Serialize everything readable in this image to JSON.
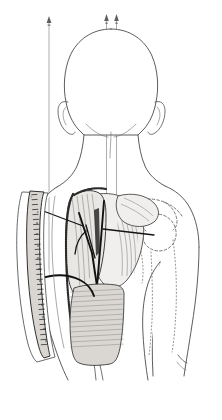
{
  "figure": {
    "view": "posterior",
    "background_color": "#ffffff",
    "ink_color": "#3d3d3d",
    "accent_black": "#111111",
    "muscle_fill": "#e9e7e4",
    "bone_outline_style": "dashed"
  },
  "leaders": {
    "description": "Thin vertical leader lines with arrowheads extending off the top of the figure",
    "items": [
      {
        "id": "leader-left",
        "label": "",
        "x": 49,
        "top_y": 18,
        "bottom_y": 284,
        "arrow": "up"
      },
      {
        "id": "leader-center",
        "label": "",
        "x": 107,
        "top_y": 15,
        "bottom_y": 215,
        "arrow": "up"
      },
      {
        "id": "leader-right",
        "label": "",
        "x": 116,
        "top_y": 15,
        "bottom_y": 205,
        "arrow": "up"
      }
    ]
  },
  "anatomy": {
    "regions": [
      {
        "name": "head",
        "label": "Head (posterior view)"
      },
      {
        "name": "neck",
        "label": "Neck"
      },
      {
        "name": "left-ear",
        "label": "Ear"
      },
      {
        "name": "right-ear",
        "label": "Ear"
      },
      {
        "name": "torso",
        "label": "Posterior trunk"
      },
      {
        "name": "right-arm",
        "label": "Upper arm"
      }
    ],
    "bones": [
      {
        "name": "scapula",
        "label": "Scapula",
        "style": "dashed"
      },
      {
        "name": "clavicle",
        "label": "Clavicle",
        "style": "dashed"
      },
      {
        "name": "humerus",
        "label": "Humerus",
        "style": "dotted"
      },
      {
        "name": "acromion",
        "label": "Acromion",
        "style": "dashed"
      }
    ],
    "flap": {
      "name": "latissimus-dorsi-flap",
      "label": "Elevated muscle flap",
      "fill": "#e9e7e4",
      "edge": "stippled incision margin"
    }
  },
  "inset": {
    "name": "donor-site-inset",
    "label": "Donor site closure detail",
    "strip_label": "Sutured incision line",
    "strip_fill": "#d9d6d2"
  },
  "pointers": [
    {
      "id": "pointer-upper-left",
      "label": ""
    },
    {
      "id": "pointer-mid-right",
      "label": ""
    },
    {
      "id": "pointer-lower-left",
      "label": ""
    },
    {
      "id": "pointer-vessel",
      "label": ""
    }
  ]
}
